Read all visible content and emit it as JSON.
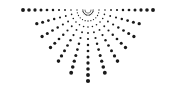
{
  "graphic": {
    "name": "half-sunburst-dots",
    "center": [
      88,
      10
    ],
    "dot_color": "#1a1a1a",
    "background": "#ffffff",
    "rays": [
      {
        "angle": 0,
        "length": 69
      },
      {
        "angle": 15,
        "length": 58
      },
      {
        "angle": 30,
        "length": 57
      },
      {
        "angle": 45,
        "length": 56
      },
      {
        "angle": 60,
        "length": 62
      },
      {
        "angle": 75,
        "length": 68
      },
      {
        "angle": 90,
        "length": 72
      },
      {
        "angle": 105,
        "length": 68
      },
      {
        "angle": 120,
        "length": 62
      },
      {
        "angle": 135,
        "length": 56
      },
      {
        "angle": 150,
        "length": 57
      },
      {
        "angle": 165,
        "length": 58
      },
      {
        "angle": 180,
        "length": 68
      }
    ],
    "inner_radius": 5,
    "dot_spacing": 6,
    "min_dot_radius": 0.5,
    "max_dot_radius": 2.1
  }
}
